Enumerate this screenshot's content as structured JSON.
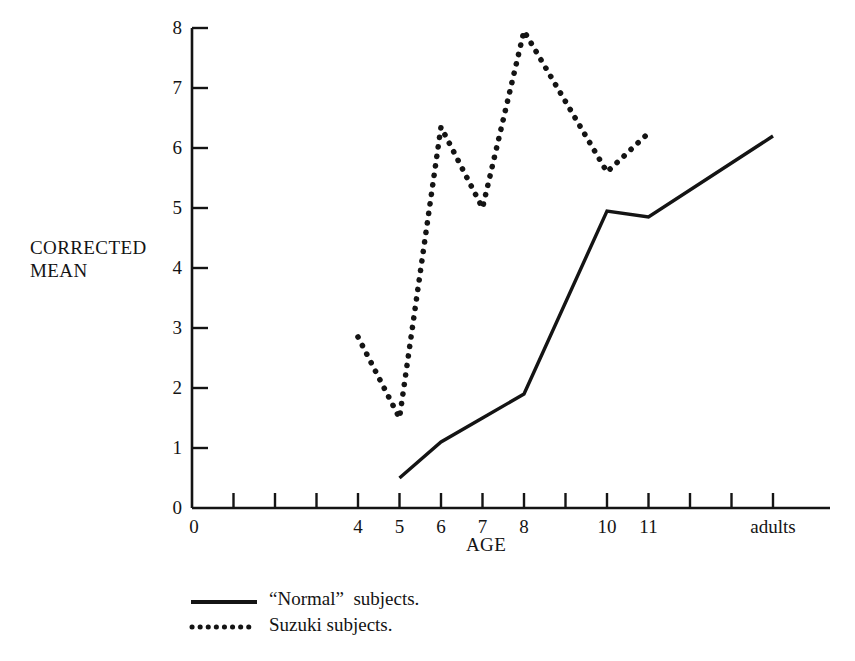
{
  "figure": {
    "name": "corrected-mean-by-age-line-chart",
    "background": "#ffffff",
    "ink_color": "#141414"
  },
  "labels": {
    "y_axis_title": "CORRECTED\nMEAN",
    "x_axis_title": "AGE"
  },
  "legend": {
    "items": [
      {
        "label": "“Normal”  subjects.",
        "style": "solid",
        "series": "normal"
      },
      {
        "label": "Suzuki subjects.",
        "style": "dotted",
        "series": "suzuki"
      }
    ]
  },
  "chart_data": {
    "type": "line",
    "title": "",
    "subtitle": "",
    "xlabel": "AGE",
    "ylabel": "CORRECTED MEAN",
    "grid": false,
    "legend_position": "below-left",
    "x_origin_label": "0",
    "categories": [
      "0",
      "",
      "",
      "",
      "4",
      "5",
      "6",
      "7",
      "8",
      "",
      "10",
      "11",
      "",
      "",
      "adults"
    ],
    "x_tick_labels": [
      "0",
      "4",
      "5",
      "6",
      "7",
      "8",
      "10",
      "11",
      "adults"
    ],
    "x_tick_indices": [
      0,
      4,
      5,
      6,
      7,
      8,
      10,
      11,
      14
    ],
    "x_tick_count": 15,
    "ylim": [
      0,
      8
    ],
    "y_tick_labels": [
      "0",
      "1",
      "2",
      "3",
      "4",
      "5",
      "6",
      "7",
      "8"
    ],
    "y_ticks": [
      0,
      1,
      2,
      3,
      4,
      5,
      6,
      7,
      8
    ],
    "series": [
      {
        "name": "“Normal” subjects.",
        "style": "solid",
        "x": [
          "5",
          "6",
          "7",
          "8",
          "10",
          "11",
          "adults"
        ],
        "x_index": [
          5,
          6,
          7,
          8,
          10,
          11,
          14
        ],
        "values": [
          0.5,
          1.1,
          1.5,
          1.9,
          4.95,
          4.85,
          6.2
        ]
      },
      {
        "name": "Suzuki subjects.",
        "style": "dotted",
        "x": [
          "4",
          "5",
          "6",
          "7",
          "8",
          "10",
          "11"
        ],
        "x_index": [
          4,
          5,
          6,
          7,
          8,
          10,
          11
        ],
        "values": [
          2.85,
          1.5,
          6.35,
          5.0,
          7.95,
          5.6,
          6.25
        ]
      }
    ]
  },
  "geometry": {
    "plot_left": 192,
    "plot_bottom": 508,
    "plot_right": 830,
    "y_value_8_px": 28,
    "px_per_unit_y": 60,
    "px_per_index_x": 41.5
  }
}
